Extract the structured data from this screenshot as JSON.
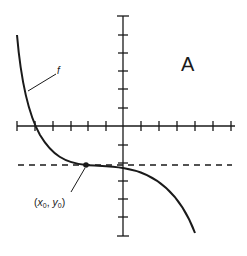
{
  "panel_label": "A",
  "function_label": "f",
  "point_label": {
    "open": "(",
    "x": "x",
    "x_sub": "0",
    "comma": ", ",
    "y": "y",
    "y_sub": "0",
    "close": ")"
  },
  "axes": {
    "x_ticks_left": 6,
    "x_ticks_right": 6,
    "y_ticks_up": 6,
    "y_ticks_down": 6
  },
  "elements": {
    "curve": "decreasing cubic-like curve with horizontal inflection",
    "tangent_line": "horizontal dashed line through (x0, y0)",
    "point": "(x0, y0)"
  },
  "colors": {
    "ink": "#1a1a1a",
    "background": "#ffffff"
  }
}
